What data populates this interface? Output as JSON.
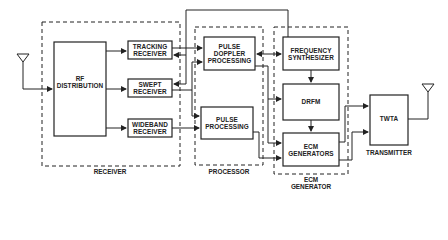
{
  "diagram": {
    "type": "block-diagram",
    "blocks": {
      "rf_distribution": "RF\nDISTRIBUTION",
      "tracking_receiver": "TRACKING\nRECEIVER",
      "swept_receiver": "SWEPT\nRECEIVER",
      "wideband_receiver": "WIDEBAND\nRECEIVER",
      "pulse_doppler_processing": "PULSE\nDOPPLER\nPROCESSING",
      "pulse_processing": "PULSE\nPROCESSING",
      "frequency_synthesizer": "FREQUENCY\nSYNTHESIZER",
      "drfm": "DRFM",
      "ecm_generators": "ECM\nGENERATORS",
      "twta": "TWTA"
    },
    "groups": {
      "receiver": "RECEIVER",
      "processor": "PROCESSOR",
      "ecm_generator": "ECM\nGENERATOR",
      "transmitter": "TRANSMITTER"
    },
    "connections": [
      {
        "from": "receive-antenna",
        "to": "RF DISTRIBUTION"
      },
      {
        "from": "RF DISTRIBUTION",
        "to": "TRACKING RECEIVER"
      },
      {
        "from": "RF DISTRIBUTION",
        "to": "SWEPT RECEIVER"
      },
      {
        "from": "RF DISTRIBUTION",
        "to": "WIDEBAND RECEIVER"
      },
      {
        "from": "TRACKING RECEIVER",
        "to": "PULSE DOPPLER PROCESSING"
      },
      {
        "from": "FREQUENCY SYNTHESIZER",
        "to": "TRACKING RECEIVER"
      },
      {
        "from": "FREQUENCY SYNTHESIZER",
        "to": "SWEPT RECEIVER"
      },
      {
        "from": "SWEPT RECEIVER",
        "to": "PULSE DOPPLER PROCESSING"
      },
      {
        "from": "SWEPT RECEIVER",
        "to": "PULSE PROCESSING"
      },
      {
        "from": "WIDEBAND RECEIVER",
        "to": "PULSE PROCESSING"
      },
      {
        "from": "PULSE DOPPLER PROCESSING",
        "to": "FREQUENCY SYNTHESIZER",
        "bidirectional": true
      },
      {
        "from": "PULSE DOPPLER PROCESSING",
        "to": "DRFM"
      },
      {
        "from": "PULSE DOPPLER PROCESSING",
        "to": "ECM GENERATORS"
      },
      {
        "from": "PULSE PROCESSING",
        "to": "ECM GENERATORS"
      },
      {
        "from": "FREQUENCY SYNTHESIZER",
        "to": "DRFM"
      },
      {
        "from": "DRFM",
        "to": "ECM GENERATORS"
      },
      {
        "from": "ECM GENERATORS",
        "to": "TWTA"
      },
      {
        "from": "ECM GENERATORS",
        "to": "TWTA"
      },
      {
        "from": "TWTA",
        "to": "transmit-antenna"
      }
    ]
  }
}
